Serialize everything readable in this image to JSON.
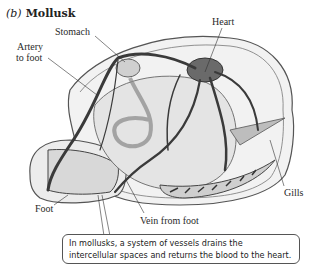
{
  "figure": {
    "panel_letter": "(b)",
    "panel_title": "Mollusk"
  },
  "labels": {
    "heart": "Heart",
    "stomach": "Stomach",
    "artery_line1": "Artery",
    "artery_line2": "to foot",
    "gills": "Gills",
    "foot": "Foot",
    "vein_from_foot": "Vein from foot"
  },
  "caption": "In mollusks, a system of vessels drains the intercellular spaces and returns the blood to the heart.",
  "colors": {
    "vessel": "#3a3a3a",
    "body_fill": "#e4e4e4",
    "shell_fill": "#f2f2f2",
    "outline": "#555555"
  }
}
